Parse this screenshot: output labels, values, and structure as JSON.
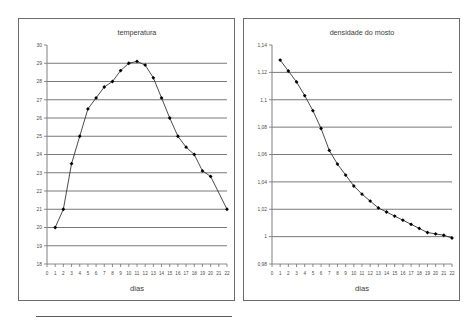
{
  "page": {
    "background_color": "#ffffff",
    "bottom_rule": {
      "name": "horizontal-rule",
      "color": "#5a5a5a"
    }
  },
  "charts": [
    {
      "id": "temperatura",
      "chart_data": {
        "type": "line",
        "title": "temperatura",
        "xlabel": "dias",
        "ylabel": "",
        "xlim": [
          0,
          22
        ],
        "ylim": [
          18,
          30
        ],
        "yticks": [
          30,
          29,
          28,
          27,
          26,
          25,
          24,
          23,
          22,
          21,
          20,
          19,
          18
        ],
        "ytick_labels": [
          "30",
          "29",
          "28",
          "27",
          "26",
          "25",
          "24",
          "23",
          "22",
          "21",
          "20",
          "19",
          "18"
        ],
        "xticks": [
          0,
          1,
          2,
          3,
          4,
          5,
          6,
          7,
          8,
          9,
          10,
          11,
          12,
          13,
          14,
          15,
          16,
          17,
          18,
          19,
          20,
          21,
          22
        ],
        "xtick_labels": [
          "0",
          "1",
          "2",
          "3",
          "4",
          "5",
          "6",
          "7",
          "8",
          "9",
          "10",
          "11",
          "12",
          "13",
          "14",
          "15",
          "16",
          "17",
          "18",
          "19",
          "20",
          "21",
          "22"
        ],
        "grid": true,
        "legend": "none",
        "marker": "filled-diamond",
        "line_color": "#2b2b2b",
        "marker_color": "#000000",
        "x": [
          1,
          2,
          3,
          4,
          5,
          6,
          7,
          8,
          9,
          10,
          11,
          12,
          13,
          14,
          15,
          16,
          17,
          18,
          19,
          20,
          22
        ],
        "values": [
          20.0,
          21.0,
          23.5,
          25.0,
          26.5,
          27.1,
          27.7,
          28.0,
          28.6,
          29.0,
          29.1,
          28.9,
          28.2,
          27.1,
          26.0,
          25.0,
          24.4,
          24.0,
          23.1,
          22.8,
          21.0
        ]
      }
    },
    {
      "id": "densidade-do-mosto",
      "chart_data": {
        "type": "line",
        "title": "densidade do mosto",
        "xlabel": "dias",
        "ylabel": "",
        "xlim": [
          0,
          22
        ],
        "ylim": [
          0.98,
          1.14
        ],
        "yticks": [
          1.14,
          1.12,
          1.1,
          1.08,
          1.06,
          1.04,
          1.02,
          1.0,
          0.98
        ],
        "ytick_labels": [
          "1,14",
          "1,12",
          "1,1",
          "1,08",
          "1,06",
          "1,04",
          "1,02",
          "1",
          "0,98"
        ],
        "xticks": [
          0,
          1,
          2,
          3,
          4,
          5,
          6,
          7,
          8,
          9,
          10,
          11,
          12,
          13,
          14,
          15,
          16,
          17,
          18,
          19,
          20,
          21,
          22
        ],
        "xtick_labels": [
          "0",
          "1",
          "2",
          "3",
          "4",
          "5",
          "6",
          "7",
          "8",
          "9",
          "10",
          "11",
          "12",
          "13",
          "14",
          "15",
          "16",
          "17",
          "18",
          "19",
          "20",
          "21",
          "22"
        ],
        "grid": true,
        "legend": "none",
        "marker": "filled-diamond",
        "line_color": "#2b2b2b",
        "marker_color": "#000000",
        "x": [
          1,
          2,
          3,
          4,
          5,
          6,
          7,
          8,
          9,
          10,
          11,
          12,
          13,
          14,
          15,
          16,
          17,
          18,
          19,
          20,
          21,
          22
        ],
        "values": [
          1.129,
          1.121,
          1.113,
          1.103,
          1.092,
          1.079,
          1.063,
          1.053,
          1.045,
          1.037,
          1.031,
          1.026,
          1.021,
          1.018,
          1.015,
          1.012,
          1.009,
          1.006,
          1.003,
          1.002,
          1.001,
          0.999
        ]
      }
    }
  ]
}
